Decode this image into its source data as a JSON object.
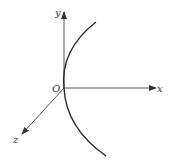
{
  "diagram": {
    "type": "3d-coordinate-axes-with-curve",
    "labels": {
      "origin": "O",
      "x_axis": "x",
      "y_axis": "y",
      "z_axis": "z"
    },
    "colors": {
      "background": "#ffffff",
      "axis": "#444444",
      "curve": "#2a2a2a",
      "text": "#333333"
    }
  }
}
